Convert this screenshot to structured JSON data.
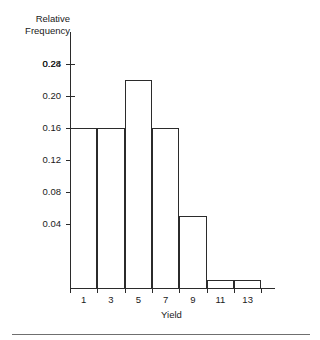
{
  "chart_data": {
    "type": "bar",
    "title": "",
    "subtitle": "",
    "xlabel": "Yield",
    "ylabel": "Relative Frequency",
    "ylabel_lines": [
      "Relative",
      "Frequency"
    ],
    "categories": [
      "1",
      "3",
      "5",
      "7",
      "9",
      "11",
      "13"
    ],
    "bin_edges": [
      0,
      2,
      4,
      6,
      8,
      10,
      12,
      14
    ],
    "values": [
      0.2,
      0.2,
      0.26,
      0.2,
      0.09,
      0.01,
      0.01
    ],
    "series": [
      {
        "name": "Relative Frequency",
        "values": [
          0.2,
          0.2,
          0.26,
          0.2,
          0.09,
          0.01,
          0.01
        ]
      }
    ],
    "xtick_labels": [
      "1",
      "3",
      "5",
      "7",
      "9",
      "11",
      "13"
    ],
    "ytick_labels": [
      "0.04",
      "0.08",
      "0.12",
      "0.16",
      "0.20",
      "0.24",
      "0.28"
    ],
    "ytick_values": [
      0.04,
      0.08,
      0.12,
      0.16,
      0.2,
      0.24,
      0.28
    ],
    "xlim": [
      0,
      15
    ],
    "ylim": [
      0,
      0.32
    ],
    "grid": false,
    "legend": false,
    "legend_position": "none",
    "bar_fill": "#ffffff",
    "bar_edge_color": "#2b2b2b",
    "axis_color": "#2b2b2b",
    "text_color": "#1a1a1a",
    "background": "#ffffff"
  },
  "figure": {
    "bottom_rule_color": "#6f6f6f"
  }
}
